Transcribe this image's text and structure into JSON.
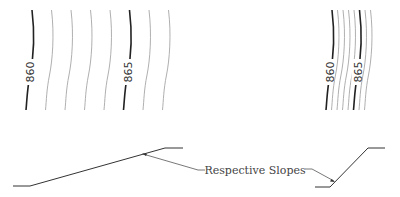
{
  "diagram": {
    "left_contours": {
      "description": "Widely spaced contours (gentle slope)",
      "start_x": 30,
      "spacing": 19.5,
      "count": 8,
      "bold_indices": [
        0,
        5
      ],
      "labels": [
        {
          "index": 0,
          "text": "860"
        },
        {
          "index": 5,
          "text": "865"
        }
      ]
    },
    "right_contours": {
      "description": "Closely spaced contours (steep slope)",
      "start_x": 330,
      "spacing": 5.5,
      "count": 8,
      "bold_indices": [
        0,
        5
      ],
      "labels": [
        {
          "index": 0,
          "text": "860"
        },
        {
          "index": 5,
          "text": "865"
        }
      ]
    },
    "callout": {
      "text": "Respective Slopes"
    },
    "colors": {
      "bold_line": "#222222",
      "thin_line": "#9a9a9a",
      "profile": "#333333",
      "text": "#444444"
    }
  }
}
